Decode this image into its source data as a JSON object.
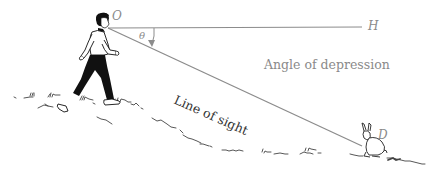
{
  "diagram": {
    "title": "Angle of depression",
    "labels": {
      "observer_point": "O",
      "horizontal_point": "H",
      "object_point": "D",
      "angle_symbol": "θ",
      "angle_name": "Angle of depression",
      "line_of_sight": "Line of sight"
    },
    "elements": {
      "observer": "person-walking",
      "object": "rabbit",
      "ground": "grassy-slope"
    },
    "colors": {
      "lines": "#8c8c8c",
      "labels": "#8a8a8a",
      "figure": "#111111"
    }
  }
}
